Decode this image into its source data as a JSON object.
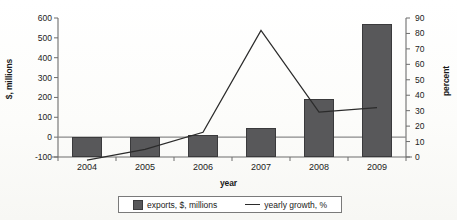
{
  "chart_data": {
    "type": "bar",
    "title": "",
    "xlabel": "year",
    "categories": [
      "2004",
      "2005",
      "2006",
      "2007",
      "2008",
      "2009"
    ],
    "grid": false,
    "legend_position": "bottom",
    "axes": {
      "left": {
        "label": "$, millions",
        "ylim": [
          -100,
          600
        ],
        "ticks": [
          600,
          500,
          400,
          300,
          200,
          100,
          0,
          -100
        ],
        "tick_labels": [
          "600",
          "500",
          "400",
          "300",
          "200",
          "100",
          "0",
          "-100"
        ]
      },
      "right": {
        "label": "percent",
        "ylim": [
          0,
          90
        ],
        "ticks": [
          90,
          80,
          70,
          60,
          50,
          40,
          30,
          20,
          10,
          0
        ],
        "tick_labels": [
          "90",
          "80",
          "70",
          "60",
          "50",
          "40",
          "30",
          "20",
          "10",
          "0"
        ]
      }
    },
    "series": [
      {
        "name": "exports, $, millions",
        "type": "bar",
        "axis": "left",
        "color": "#58585a",
        "values": [
          2,
          3,
          10,
          45,
          190,
          570
        ]
      },
      {
        "name": "yearly growth, %",
        "type": "line",
        "axis": "right",
        "color": "#2b2b2b",
        "values": [
          -2,
          5,
          16,
          82,
          29,
          32
        ]
      }
    ]
  },
  "legend": {
    "items": [
      {
        "label": "exports, $, millions",
        "marker": "square-swatch"
      },
      {
        "label": "yearly growth, %",
        "marker": "line-segment"
      }
    ]
  }
}
